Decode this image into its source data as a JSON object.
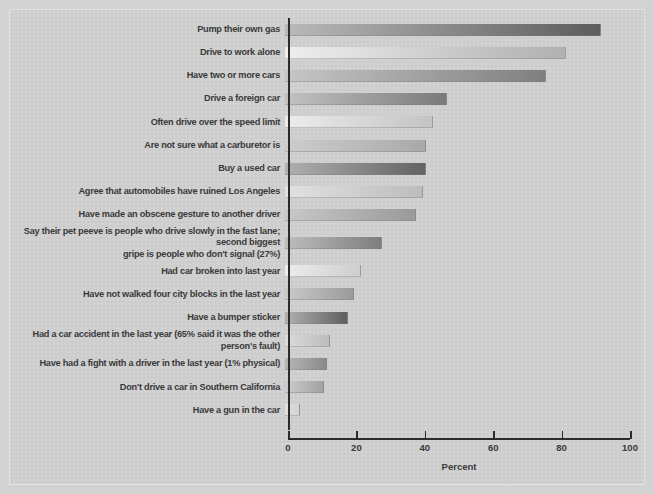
{
  "chart_data": {
    "type": "bar",
    "orientation": "horizontal",
    "title": "",
    "xlabel": "Percent",
    "ylabel": "",
    "xlim": [
      0,
      100
    ],
    "xticks": [
      0,
      20,
      40,
      60,
      80,
      100
    ],
    "grid": false,
    "legend": null,
    "categories": [
      "Pump their own gas",
      "Drive to work alone",
      "Have two or more cars",
      "Drive a foreign car",
      "Often drive over the speed limit",
      "Are not sure what a carburetor is",
      "Buy a used car",
      "Agree that automobiles have ruined Los Angeles",
      "Have made an obscene gesture to another driver",
      "Say their pet peeve is people who drive slowly in the fast lane; second biggest\ngripe  is people who don't signal (27%)",
      "Had car broken into last year",
      "Have not walked four city blocks in the last year",
      "Have a bumper sticker",
      "Had a car accident in the last year (65% said it was the other person's fault)",
      "Have had a fight with a driver in the last year (1% physical)",
      "Don't drive a car in Southern California",
      "Have a gun in the car"
    ],
    "values": [
      92,
      82,
      76,
      47,
      43,
      41,
      41,
      40,
      38,
      28,
      22,
      20,
      18,
      13,
      12,
      11,
      4
    ],
    "bar_shades": [
      {
        "from": "#b9b9b9",
        "to": "#5d5d5d"
      },
      {
        "from": "#efefef",
        "to": "#b0b0b0"
      },
      {
        "from": "#c6c6c6",
        "to": "#7f7f7f"
      },
      {
        "from": "#c2c2c2",
        "to": "#7a7a7a"
      },
      {
        "from": "#ececec",
        "to": "#c4c4c4"
      },
      {
        "from": "#cdcdcd",
        "to": "#a9a9a9"
      },
      {
        "from": "#b0b0b0",
        "to": "#636363"
      },
      {
        "from": "#e2e2e2",
        "to": "#bcbcbc"
      },
      {
        "from": "#c8c8c8",
        "to": "#9a9a9a"
      },
      {
        "from": "#bdbdbd",
        "to": "#7e7e7e"
      },
      {
        "from": "#ececec",
        "to": "#cfcfcf"
      },
      {
        "from": "#c9c9c9",
        "to": "#9b9b9b"
      },
      {
        "from": "#b2b2b2",
        "to": "#5f5f5f"
      },
      {
        "from": "#dcdcdc",
        "to": "#bdbdbd"
      },
      {
        "from": "#b7b7b7",
        "to": "#8a8a8a"
      },
      {
        "from": "#cccccc",
        "to": "#a2a2a2"
      },
      {
        "from": "#e0e0e0",
        "to": "#d2d2d2"
      }
    ]
  },
  "colors": {
    "background": "#cfcfcf",
    "axis": "#2b2b2b",
    "text": "#3a3a3a",
    "frame": "#d2d2d2"
  }
}
